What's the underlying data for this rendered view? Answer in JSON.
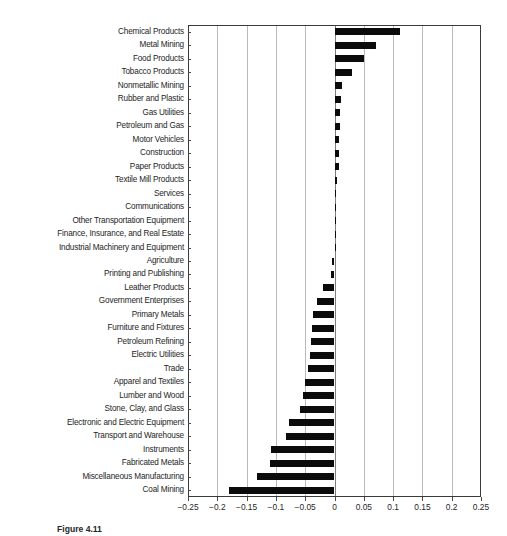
{
  "caption": "Figure 4.11",
  "chart_data": {
    "type": "bar",
    "orientation": "horizontal",
    "title": "",
    "xlabel": "",
    "ylabel": "",
    "xlim": [
      -0.25,
      0.25
    ],
    "xticks": [
      -0.25,
      -0.2,
      -0.15,
      -0.1,
      -0.05,
      0,
      0.05,
      0.1,
      0.15,
      0.2,
      0.25
    ],
    "xtick_labels": [
      "−0.25",
      "−0.2",
      "−0.15",
      "−0.1",
      "−0.05",
      "0",
      "0.05",
      "0.1",
      "0.15",
      "0.2",
      "0.25"
    ],
    "grid": true,
    "grid_axis": "x",
    "legend": false,
    "bar_color": "#0b0b0b",
    "categories": [
      "Chemical Products",
      "Metal Mining",
      "Food Products",
      "Tobacco Products",
      "Nonmetallic Mining",
      "Rubber and Plastic",
      "Gas Utilities",
      "Petroleum and Gas",
      "Motor Vehicles",
      "Construction",
      "Paper Products",
      "Textile Mill Products",
      "Services",
      "Communications",
      "Other Transportation Equipment",
      "Finance, Insurance, and Real Estate",
      "Industrial Machinery and Equipment",
      "Agriculture",
      "Printing and Publishing",
      "Leather Products",
      "Government Enterprises",
      "Primary Metals",
      "Furniture and Fixtures",
      "Petroleum Refining",
      "Electric Utilities",
      "Trade",
      "Apparel and Textiles",
      "Lumber and Wood",
      "Stone, Clay, and Glass",
      "Electronic and Electric Equipment",
      "Transport and Warehouse",
      "Instruments",
      "Fabricated Metals",
      "Miscellaneous Manufacturing",
      "Coal Mining"
    ],
    "values": [
      0.112,
      0.07,
      0.05,
      0.03,
      0.012,
      0.011,
      0.009,
      0.009,
      0.008,
      0.008,
      0.007,
      0.004,
      0.003,
      0.002,
      0.001,
      0.0005,
      0.0005,
      -0.004,
      -0.006,
      -0.019,
      -0.03,
      -0.036,
      -0.038,
      -0.04,
      -0.041,
      -0.046,
      -0.05,
      -0.053,
      -0.059,
      -0.078,
      -0.082,
      -0.108,
      -0.11,
      -0.132,
      -0.18
    ]
  }
}
